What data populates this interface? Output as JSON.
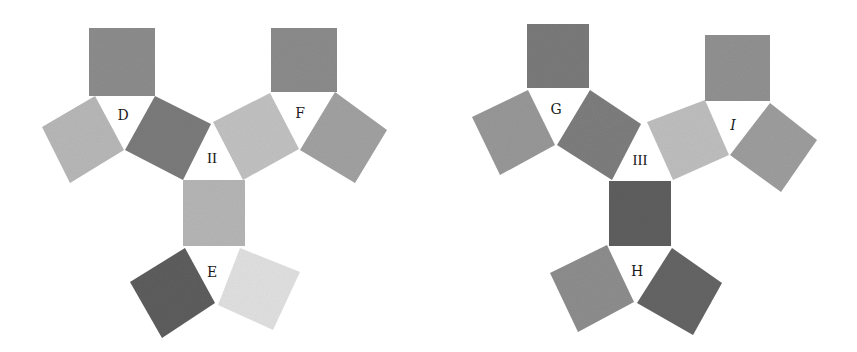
{
  "figure": {
    "groups": [
      {
        "id": "II",
        "center_label": "II",
        "center_triangle": [
          [
            183,
            180
          ],
          [
            211,
            124
          ],
          [
            243,
            180
          ]
        ],
        "center_label_pos": [
          212,
          163
        ],
        "triangles": [
          {
            "label": "D",
            "label_pos": [
              123,
              120
            ],
            "triangle": [
              [
                95,
                96
              ],
              [
                155,
                96
              ],
              [
                125,
                150
              ]
            ],
            "squares": [
              {
                "name": "D-top",
                "fill": "#8e8e8e",
                "points": [
                  [
                    89,
                    28
                  ],
                  [
                    155,
                    28
                  ],
                  [
                    155,
                    96
                  ],
                  [
                    89,
                    96
                  ]
                ]
              },
              {
                "name": "D-left",
                "fill": "#b9b9b9",
                "points": [
                  [
                    42,
                    127
                  ],
                  [
                    95,
                    96
                  ],
                  [
                    124,
                    150
                  ],
                  [
                    70,
                    183
                  ]
                ]
              },
              {
                "name": "D-right",
                "fill": "#7d7d7d",
                "points": [
                  [
                    155,
                    96
                  ],
                  [
                    211,
                    124
                  ],
                  [
                    183,
                    180
                  ],
                  [
                    125,
                    150
                  ]
                ]
              }
            ]
          },
          {
            "label": "F",
            "label_pos": [
              300,
              118
            ],
            "triangle": [
              [
                270,
                93
              ],
              [
                335,
                92
              ],
              [
                300,
                150
              ]
            ],
            "squares": [
              {
                "name": "F-top",
                "fill": "#8d8d8d",
                "points": [
                  [
                    271,
                    28
                  ],
                  [
                    337,
                    28
                  ],
                  [
                    337,
                    92
                  ],
                  [
                    271,
                    92
                  ]
                ]
              },
              {
                "name": "F-left",
                "fill": "#c3c3c3",
                "points": [
                  [
                    213,
                    122
                  ],
                  [
                    270,
                    93
                  ],
                  [
                    299,
                    149
                  ],
                  [
                    243,
                    180
                  ]
                ]
              },
              {
                "name": "F-right",
                "fill": "#a3a3a3",
                "points": [
                  [
                    335,
                    92
                  ],
                  [
                    387,
                    130
                  ],
                  [
                    355,
                    183
                  ],
                  [
                    300,
                    150
                  ]
                ]
              }
            ]
          },
          {
            "label": "E",
            "label_pos": [
              212,
              277
            ],
            "triangle": [
              [
                185,
                248
              ],
              [
                240,
                248
              ],
              [
                216,
                304
              ]
            ],
            "squares": [
              {
                "name": "E-top",
                "fill": "#b7b7b7",
                "points": [
                  [
                    183,
                    180
                  ],
                  [
                    245,
                    180
                  ],
                  [
                    245,
                    246
                  ],
                  [
                    183,
                    246
                  ]
                ]
              },
              {
                "name": "E-left",
                "fill": "#5e5e5e",
                "points": [
                  [
                    130,
                    282
                  ],
                  [
                    185,
                    248
                  ],
                  [
                    215,
                    303
                  ],
                  [
                    162,
                    338
                  ]
                ]
              },
              {
                "name": "E-right",
                "fill": "#e2e2e2",
                "points": [
                  [
                    240,
                    248
                  ],
                  [
                    300,
                    272
                  ],
                  [
                    273,
                    330
                  ],
                  [
                    218,
                    305
                  ]
                ]
              }
            ]
          }
        ]
      },
      {
        "id": "III",
        "center_label": "III",
        "center_triangle": [
          [
            609,
            181
          ],
          [
            641,
            124
          ],
          [
            671,
            181
          ]
        ],
        "center_label_pos": [
          640,
          165
        ],
        "triangles": [
          {
            "label": "G",
            "label_pos": [
              556,
              114
            ],
            "triangle": [
              [
                528,
                90
              ],
              [
                590,
                90
              ],
              [
                557,
                145
              ]
            ],
            "squares": [
              {
                "name": "G-top",
                "fill": "#7c7c7c",
                "points": [
                  [
                    527,
                    24
                  ],
                  [
                    589,
                    24
                  ],
                  [
                    589,
                    88
                  ],
                  [
                    527,
                    88
                  ]
                ]
              },
              {
                "name": "G-left",
                "fill": "#9a9a9a",
                "points": [
                  [
                    472,
                    117
                  ],
                  [
                    528,
                    90
                  ],
                  [
                    555,
                    145
                  ],
                  [
                    500,
                    175
                  ]
                ]
              },
              {
                "name": "G-right",
                "fill": "#7f7f7f",
                "points": [
                  [
                    590,
                    90
                  ],
                  [
                    641,
                    124
                  ],
                  [
                    612,
                    180
                  ],
                  [
                    557,
                    145
                  ]
                ]
              }
            ]
          },
          {
            "label": "I",
            "label_pos": [
              733,
              130
            ],
            "triangle": [
              [
                705,
                100
              ],
              [
                770,
                103
              ],
              [
                730,
                155
              ]
            ],
            "squares": [
              {
                "name": "I-top",
                "fill": "#939393",
                "points": [
                  [
                    705,
                    35
                  ],
                  [
                    770,
                    35
                  ],
                  [
                    770,
                    101
                  ],
                  [
                    705,
                    101
                  ]
                ]
              },
              {
                "name": "I-left",
                "fill": "#c0c0c0",
                "points": [
                  [
                    647,
                    122
                  ],
                  [
                    705,
                    100
                  ],
                  [
                    729,
                    155
                  ],
                  [
                    673,
                    180
                  ]
                ]
              },
              {
                "name": "I-right",
                "fill": "#9f9f9f",
                "points": [
                  [
                    770,
                    103
                  ],
                  [
                    817,
                    140
                  ],
                  [
                    781,
                    192
                  ],
                  [
                    730,
                    155
                  ]
                ]
              }
            ]
          },
          {
            "label": "H",
            "label_pos": [
              637,
              276
            ],
            "triangle": [
              [
                607,
                245
              ],
              [
                672,
                248
              ],
              [
                636,
                303
              ]
            ],
            "squares": [
              {
                "name": "H-top",
                "fill": "#606060",
                "points": [
                  [
                    609,
                    181
                  ],
                  [
                    671,
                    181
                  ],
                  [
                    671,
                    246
                  ],
                  [
                    609,
                    246
                  ]
                ]
              },
              {
                "name": "H-left",
                "fill": "#8f8f8f",
                "points": [
                  [
                    550,
                    273
                  ],
                  [
                    607,
                    245
                  ],
                  [
                    634,
                    302
                  ],
                  [
                    578,
                    332
                  ]
                ]
              },
              {
                "name": "H-right",
                "fill": "#666666",
                "points": [
                  [
                    672,
                    248
                  ],
                  [
                    722,
                    283
                  ],
                  [
                    693,
                    335
                  ],
                  [
                    637,
                    303
                  ]
                ]
              }
            ]
          }
        ]
      }
    ]
  }
}
